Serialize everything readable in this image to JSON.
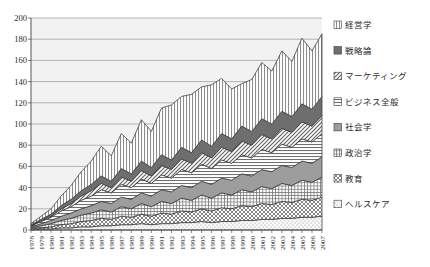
{
  "chart_data": {
    "type": "area",
    "stacked": true,
    "title": "",
    "xlabel": "",
    "ylabel": "",
    "ylim": [
      0,
      200
    ],
    "ytick_step": 20,
    "yticks": [
      0,
      20,
      40,
      60,
      80,
      100,
      120,
      140,
      160,
      180,
      200
    ],
    "grid": true,
    "legend_position": "right",
    "categories": [
      "1978",
      "1979",
      "1980",
      "1981",
      "1982",
      "1983",
      "1984",
      "1985",
      "1986",
      "1987",
      "1988",
      "1989",
      "1990",
      "1991",
      "1992",
      "1993",
      "1994",
      "1995",
      "1996",
      "1997",
      "1998",
      "1999",
      "2000",
      "2001",
      "2002",
      "2003",
      "2004",
      "2005",
      "2006",
      "2007"
    ],
    "series": [
      {
        "name": "ヘルスケア",
        "pattern": "dots-sparse",
        "values": [
          0,
          1,
          1,
          2,
          2,
          3,
          3,
          4,
          4,
          5,
          5,
          6,
          5,
          6,
          6,
          7,
          7,
          8,
          7,
          8,
          8,
          9,
          9,
          10,
          10,
          11,
          11,
          12,
          12,
          13
        ]
      },
      {
        "name": "教育",
        "pattern": "crosshatch",
        "values": [
          1,
          1,
          2,
          3,
          4,
          5,
          6,
          7,
          6,
          8,
          7,
          9,
          8,
          10,
          9,
          11,
          10,
          12,
          11,
          13,
          12,
          14,
          13,
          15,
          14,
          16,
          15,
          17,
          16,
          18
        ]
      },
      {
        "name": "政治学",
        "pattern": "grid-fine",
        "values": [
          1,
          2,
          3,
          4,
          5,
          6,
          7,
          8,
          7,
          9,
          8,
          10,
          9,
          11,
          10,
          12,
          11,
          13,
          12,
          14,
          13,
          15,
          14,
          16,
          15,
          17,
          16,
          18,
          17,
          19
        ]
      },
      {
        "name": "社会学",
        "pattern": "solid-gray",
        "values": [
          1,
          2,
          3,
          4,
          5,
          6,
          7,
          8,
          8,
          9,
          9,
          10,
          10,
          11,
          11,
          12,
          12,
          13,
          13,
          14,
          14,
          15,
          15,
          16,
          16,
          17,
          17,
          18,
          18,
          19
        ]
      },
      {
        "name": "ビジネス全般",
        "pattern": "hlines",
        "values": [
          1,
          2,
          3,
          5,
          6,
          8,
          9,
          11,
          10,
          12,
          11,
          13,
          12,
          14,
          13,
          15,
          14,
          16,
          15,
          17,
          16,
          18,
          17,
          19,
          18,
          20,
          19,
          21,
          20,
          22
        ]
      },
      {
        "name": "マーケティング",
        "pattern": "diagonal",
        "values": [
          0,
          1,
          1,
          2,
          3,
          4,
          5,
          6,
          5,
          7,
          6,
          8,
          7,
          9,
          8,
          10,
          9,
          11,
          10,
          12,
          11,
          13,
          12,
          14,
          13,
          15,
          14,
          16,
          15,
          17
        ]
      },
      {
        "name": "戦略論",
        "pattern": "solid-darkgray",
        "values": [
          1,
          1,
          2,
          3,
          4,
          5,
          6,
          7,
          6,
          8,
          7,
          9,
          8,
          10,
          9,
          11,
          10,
          12,
          11,
          13,
          12,
          14,
          13,
          15,
          14,
          16,
          15,
          17,
          16,
          18
        ]
      },
      {
        "name": "経営学",
        "pattern": "vlines",
        "values": [
          1,
          3,
          5,
          9,
          13,
          18,
          22,
          28,
          24,
          33,
          29,
          39,
          34,
          44,
          52,
          48,
          55,
          50,
          58,
          52,
          47,
          40,
          49,
          53,
          50,
          57,
          52,
          62,
          55,
          59
        ]
      }
    ],
    "totals": [
      6,
      13,
      20,
      32,
      42,
      55,
      65,
      79,
      70,
      91,
      82,
      104,
      93,
      115,
      118,
      126,
      128,
      135,
      137,
      143,
      133,
      138,
      142,
      155,
      150,
      169,
      159,
      181,
      169,
      185
    ]
  },
  "legend": {
    "items": [
      {
        "label": "経営学",
        "pattern": "vlines"
      },
      {
        "label": "戦略論",
        "pattern": "solid-darkgray"
      },
      {
        "label": "マーケティング",
        "pattern": "diagonal"
      },
      {
        "label": "ビジネス全般",
        "pattern": "hlines"
      },
      {
        "label": "社会学",
        "pattern": "solid-gray"
      },
      {
        "label": "政治学",
        "pattern": "grid-fine"
      },
      {
        "label": "教育",
        "pattern": "crosshatch"
      },
      {
        "label": "ヘルスケア",
        "pattern": "dots-sparse"
      }
    ]
  },
  "colors": {
    "plot_bg": "#f2f2f2",
    "grid": "#9a9a9a",
    "axis": "#555555",
    "series_line": "#3a3a3a",
    "solid_gray": "#9d9d9d",
    "solid_darkgray": "#6e6e6e",
    "text": "#2b2b2b"
  }
}
